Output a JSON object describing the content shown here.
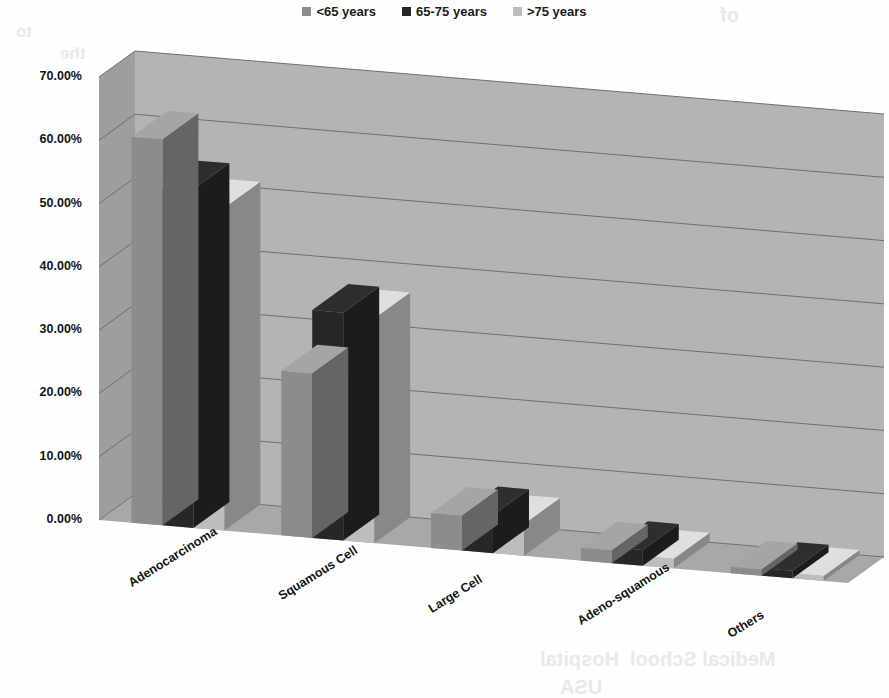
{
  "legend": {
    "items": [
      {
        "label": "<65 years",
        "color": "#8c8c8c"
      },
      {
        "label": "65-75 years",
        "color": "#272727"
      },
      {
        "label": ">75 years",
        "color": "#bdbdbd"
      }
    ]
  },
  "axes": {
    "y_ticks": [
      "70.00%",
      "60.00%",
      "50.00%",
      "40.00%",
      "30.00%",
      "20.00%",
      "10.00%",
      "0.00%"
    ],
    "x_categories": [
      "Adenocarcinoma",
      "Squamous Cell",
      "Large Cell",
      "Adeno-squamous",
      "Others"
    ]
  },
  "ghost_text": [
    {
      "text": "of",
      "x": 720,
      "y": 4,
      "size": 20
    },
    {
      "text": "to",
      "x": 16,
      "y": 22,
      "size": 17
    },
    {
      "text": "the",
      "x": 60,
      "y": 44,
      "size": 17
    },
    {
      "text": "patients",
      "x": 300,
      "y": 92,
      "size": 17
    },
    {
      "text": "are",
      "x": 690,
      "y": 96,
      "size": 17
    },
    {
      "text": "and",
      "x": 404,
      "y": 120,
      "size": 17
    },
    {
      "text": "60-69",
      "x": 500,
      "y": 124,
      "size": 17
    },
    {
      "text": "years",
      "x": 286,
      "y": 150,
      "size": 17
    },
    {
      "text": "had",
      "x": 400,
      "y": 152,
      "size": 17
    },
    {
      "text": "the",
      "x": 700,
      "y": 156,
      "size": 17
    },
    {
      "text": "original",
      "x": 330,
      "y": 178,
      "size": 17
    },
    {
      "text": "Patients",
      "x": 440,
      "y": 218,
      "size": 17
    },
    {
      "text": "which",
      "x": 790,
      "y": 212,
      "size": 17
    },
    {
      "text": "subtype",
      "x": 470,
      "y": 338,
      "size": 17
    },
    {
      "text": "remaining",
      "x": 430,
      "y": 392,
      "size": 17
    },
    {
      "text": "histology",
      "x": 470,
      "y": 424,
      "size": 17
    },
    {
      "text": "cohort",
      "x": 470,
      "y": 450,
      "size": 17
    },
    {
      "text": "of",
      "x": 510,
      "y": 478,
      "size": 17
    },
    {
      "text": "Hospital",
      "x": 540,
      "y": 648,
      "size": 20
    },
    {
      "text": "Medical School",
      "x": 630,
      "y": 648,
      "size": 20
    },
    {
      "text": "USA",
      "x": 560,
      "y": 676,
      "size": 20
    }
  ],
  "chart_data": {
    "type": "bar",
    "title": "",
    "xlabel": "",
    "ylabel": "",
    "ylim": [
      0,
      70
    ],
    "grid": true,
    "legend_position": "top-center",
    "categories": [
      "Adenocarcinoma",
      "Squamous Cell",
      "Large Cell",
      "Adeno-squamous",
      "Others"
    ],
    "series": [
      {
        "name": "<65 years",
        "color": "#8c8c8c",
        "values": [
          61.0,
          26.0,
          5.5,
          2.0,
          1.0
        ]
      },
      {
        "name": "65-75 years",
        "color": "#272727",
        "values": [
          53.5,
          36.0,
          6.0,
          2.5,
          1.2
        ]
      },
      {
        "name": ">75 years",
        "color": "#bdbdbd",
        "values": [
          51.0,
          35.5,
          5.0,
          1.5,
          0.8
        ]
      }
    ]
  }
}
